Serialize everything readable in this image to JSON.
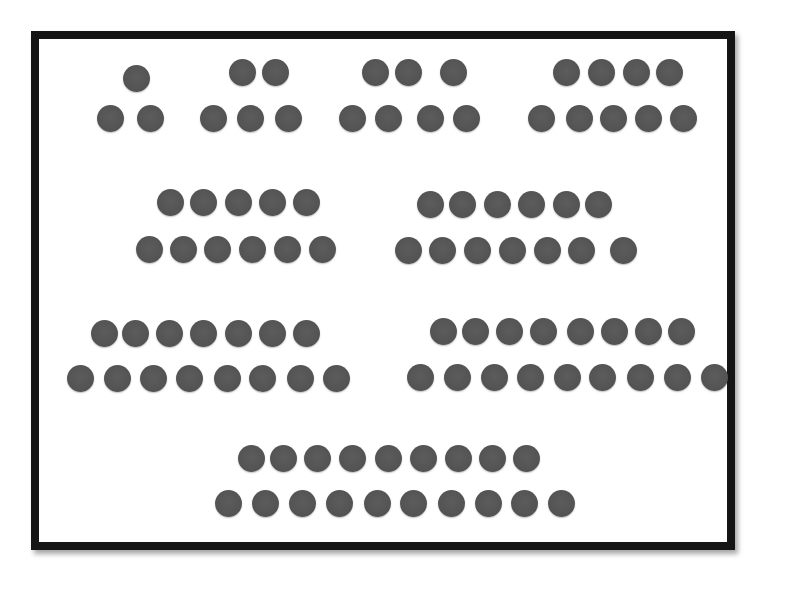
{
  "figure": {
    "dot_color": "#555555",
    "frame_color": "#151515",
    "background": "#ffffff",
    "groups": [
      {
        "n": 1,
        "top_y": 78,
        "bottom_y": 118,
        "top_x": [
          136
        ],
        "bottom_x": [
          110,
          150
        ]
      },
      {
        "n": 2,
        "top_y": 72,
        "bottom_y": 118,
        "top_x": [
          242,
          275
        ],
        "bottom_x": [
          213,
          250,
          288
        ]
      },
      {
        "n": 3,
        "top_y": 72,
        "bottom_y": 118,
        "top_x": [
          375,
          408,
          453
        ],
        "bottom_x": [
          352,
          388,
          430,
          466
        ]
      },
      {
        "n": 4,
        "top_y": 72,
        "bottom_y": 118,
        "top_x": [
          566,
          601,
          636,
          669
        ],
        "bottom_x": [
          541,
          579,
          613,
          648,
          683
        ]
      },
      {
        "n": 5,
        "top_y": 202,
        "bottom_y": 249,
        "top_x": [
          170,
          203,
          238,
          272,
          306
        ],
        "bottom_x": [
          149,
          183,
          217,
          252,
          287,
          322
        ]
      },
      {
        "n": 6,
        "top_y": 204,
        "bottom_y": 250,
        "top_x": [
          430,
          462,
          497,
          531,
          566,
          598
        ],
        "bottom_x": [
          408,
          442,
          477,
          512,
          547,
          581,
          623
        ]
      },
      {
        "n": 7,
        "top_y": 333,
        "bottom_y": 378,
        "top_x": [
          104,
          135,
          169,
          203,
          238,
          272,
          306
        ],
        "bottom_x": [
          80,
          117,
          153,
          189,
          227,
          262,
          300,
          336
        ]
      },
      {
        "n": 8,
        "top_y": 331,
        "bottom_y": 377,
        "top_x": [
          443,
          475,
          509,
          543,
          580,
          614,
          648,
          681
        ],
        "bottom_x": [
          420,
          457,
          494,
          530,
          567,
          602,
          640,
          677,
          714
        ]
      },
      {
        "n": 9,
        "top_y": 458,
        "bottom_y": 503,
        "top_x": [
          251,
          283,
          317,
          352,
          388,
          423,
          458,
          492,
          526
        ],
        "bottom_x": [
          228,
          265,
          302,
          339,
          377,
          413,
          451,
          488,
          524,
          561
        ]
      }
    ]
  }
}
